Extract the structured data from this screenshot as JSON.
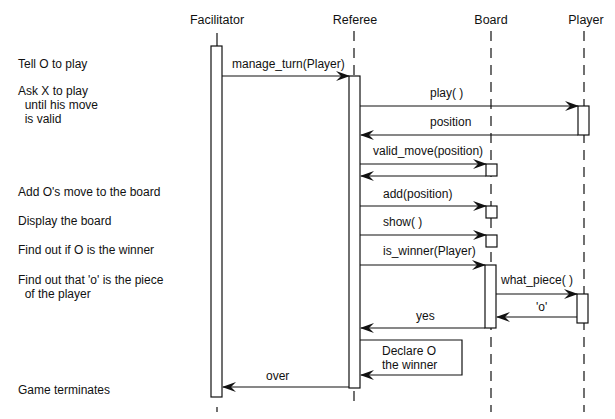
{
  "actors": [
    {
      "name": "Facilitator",
      "x": 217
    },
    {
      "name": "Referee",
      "x": 354
    },
    {
      "name": "Board",
      "x": 491
    },
    {
      "name": "Player",
      "x": 584
    }
  ],
  "descriptions": [
    {
      "text": "Tell O to play",
      "y": 58
    },
    {
      "text": "Ask X to play\n  until his move\n  is valid",
      "y": 84
    },
    {
      "text": "Add O's move to the board",
      "y": 185
    },
    {
      "text": "Display the board",
      "y": 214
    },
    {
      "text": "Find out if O is the winner",
      "y": 243
    },
    {
      "text": "Find out that 'o' is the piece\n  of the player",
      "y": 273
    },
    {
      "text": "Game terminates",
      "y": 383
    }
  ],
  "messages": [
    {
      "label": "manage_turn(Player)",
      "from": "Facilitator",
      "to": "Referee",
      "y": 76
    },
    {
      "label": "play( )",
      "from": "Referee",
      "to": "Player",
      "y": 106
    },
    {
      "label": "position",
      "from": "Player",
      "to": "Referee",
      "y": 135
    },
    {
      "label": "valid_move(position)",
      "from": "Referee",
      "to": "Board",
      "y": 164
    },
    {
      "label": "",
      "from": "Board",
      "to": "Referee",
      "y": 176
    },
    {
      "label": "add(position)",
      "from": "Referee",
      "to": "Board",
      "y": 206
    },
    {
      "label": "show( )",
      "from": "Referee",
      "to": "Board",
      "y": 235
    },
    {
      "label": "is_winner(Player)",
      "from": "Referee",
      "to": "Board",
      "y": 265
    },
    {
      "label": "what_piece( )",
      "from": "Board",
      "to": "Player",
      "y": 294
    },
    {
      "label": "'o'",
      "from": "Player",
      "to": "Board",
      "y": 317
    },
    {
      "label": "yes",
      "from": "Board",
      "to": "Referee",
      "y": 328
    },
    {
      "label": "Declare O\nthe winner",
      "from": "Referee",
      "to": "Referee",
      "y": 376,
      "self": true
    },
    {
      "label": "over",
      "from": "Referee",
      "to": "Facilitator",
      "y": 387
    }
  ]
}
